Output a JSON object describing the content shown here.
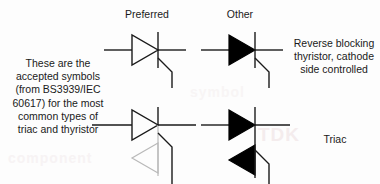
{
  "diagram": {
    "background_color": "#fdfdfd",
    "stroke_color": "#1a1a1a",
    "fill_color": "#000000",
    "faint_stroke_color": "#b9b9b9",
    "watermark_color": "#f4eced"
  },
  "headers": {
    "preferred": "Preferred",
    "other": "Other"
  },
  "captions": {
    "left": {
      "lines": [
        "These are the",
        "accepted symbols",
        "(from BS3939/IEC",
        "60617) for the most",
        "common types of",
        "triac and thyristor"
      ]
    },
    "right_top": {
      "lines": [
        "Reverse blocking",
        "thyristor, cathode",
        "side controlled"
      ]
    },
    "right_bottom": {
      "lines": [
        "Triac"
      ]
    }
  },
  "watermarks": {
    "a": "TDK",
    "b": "component",
    "c": "symbol"
  },
  "symbols": [
    {
      "id": "thyristor-preferred",
      "row": 1,
      "column": "preferred",
      "name": "Reverse blocking thyristor, cathode side controlled",
      "style": "outline",
      "triangles": [
        {
          "direction": "right",
          "filled": false
        }
      ],
      "has_cathode_bar": true,
      "has_gate_lead": true
    },
    {
      "id": "thyristor-other",
      "row": 1,
      "column": "other",
      "name": "Reverse blocking thyristor, cathode side controlled",
      "style": "filled",
      "triangles": [
        {
          "direction": "right",
          "filled": true
        }
      ],
      "has_cathode_bar": true,
      "has_gate_lead": true
    },
    {
      "id": "triac-preferred",
      "row": 2,
      "column": "preferred",
      "name": "Triac",
      "style": "outline",
      "triangles": [
        {
          "direction": "right",
          "filled": false
        },
        {
          "direction": "left",
          "filled": false
        }
      ],
      "has_cathode_bar": true,
      "has_gate_lead": true
    },
    {
      "id": "triac-other",
      "row": 2,
      "column": "other",
      "name": "Triac",
      "style": "filled",
      "triangles": [
        {
          "direction": "right",
          "filled": true
        },
        {
          "direction": "left",
          "filled": true
        }
      ],
      "has_cathode_bar": true,
      "has_gate_lead": true
    }
  ]
}
